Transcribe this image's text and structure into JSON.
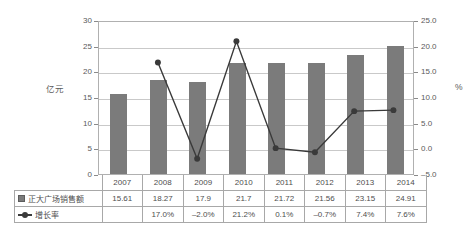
{
  "chart_data": {
    "type": "bar",
    "title": "",
    "categories": [
      "2007",
      "2008",
      "2009",
      "2010",
      "2011",
      "2012",
      "2013",
      "2014"
    ],
    "series": [
      {
        "name": "正大广场销售额",
        "type": "bar",
        "axis": "left",
        "values": [
          15.61,
          18.27,
          17.9,
          21.7,
          21.72,
          21.56,
          23.15,
          24.91
        ]
      },
      {
        "name": "增长率",
        "type": "line",
        "axis": "right",
        "values": [
          null,
          17.0,
          -2.0,
          21.2,
          0.1,
          -0.7,
          7.4,
          7.6
        ],
        "value_labels": [
          "",
          "17.0%",
          "-2.0%",
          "21.2%",
          "0.1%",
          "-0.7%",
          "7.4%",
          "7.6%"
        ]
      }
    ],
    "xlabel": "",
    "ylabel": "亿元",
    "ylabel_right": "%",
    "ylim": [
      0,
      30
    ],
    "yticks": [
      "0",
      "5",
      "10",
      "15",
      "20",
      "25",
      "30"
    ],
    "ylim_right": [
      -5.0,
      25.0
    ],
    "yticks_right": [
      "-5.0",
      "0.0",
      "5.0",
      "10.0",
      "15.0",
      "20.0",
      "25.0"
    ],
    "grid": true,
    "legend_position": "table-below"
  },
  "axes": {
    "left_title": "亿元",
    "right_title": "%",
    "left_ticks": [
      "30",
      "25",
      "20",
      "15",
      "10",
      "5",
      "0"
    ],
    "right_ticks": [
      "25.0",
      "20.0",
      "15.0",
      "10.0",
      "5.0",
      "0.0",
      "-5.0"
    ]
  },
  "table": {
    "year_row": [
      "2007",
      "2008",
      "2009",
      "2010",
      "2011",
      "2012",
      "2013",
      "2014"
    ],
    "rows": [
      {
        "marker": "bar-swatch",
        "label": "正大广场销售额",
        "values": [
          "15.61",
          "18.27",
          "17.9",
          "21.7",
          "21.72",
          "21.56",
          "23.15",
          "24.91"
        ]
      },
      {
        "marker": "line-swatch",
        "label": "增长率",
        "values": [
          "",
          "17.0%",
          "-2.0%",
          "21.2%",
          "0.1%",
          "-0.7%",
          "7.4%",
          "7.6%"
        ]
      }
    ]
  },
  "colors": {
    "bar": "#7b7b7b",
    "line": "#3a3a3a",
    "grid": "#c9c9c9",
    "axis": "#b0b0b0",
    "text": "#4e4e4e",
    "background": "#ffffff"
  }
}
